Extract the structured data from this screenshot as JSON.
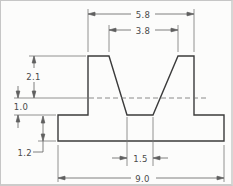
{
  "drawing": {
    "dimensions": {
      "top_outer": "5.8",
      "top_inner": "3.8",
      "upper_height": "2.1",
      "mid_height": "1.0",
      "base_thickness": "1.2",
      "slot_bottom_width": "1.5",
      "overall_width": "9.0"
    },
    "colors": {
      "outline": "#3b3b3b",
      "thin_line": "#6e6e6e",
      "text": "#4a4a4a",
      "background": "#fcfcfb"
    }
  }
}
